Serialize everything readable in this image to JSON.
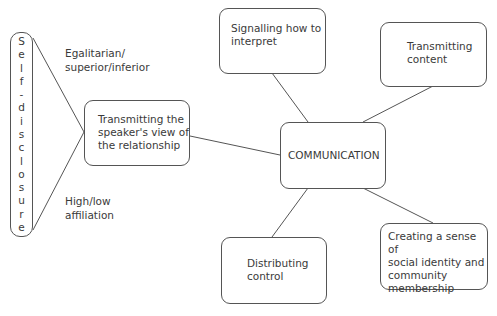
{
  "diagram": {
    "type": "concept-map",
    "central_node": {
      "id": "communication",
      "label": "COMMUNICATION"
    },
    "nodes": {
      "signalling": {
        "label": "Signalling how to\ninterpret"
      },
      "transmitting_content": {
        "label": "Transmitting\ncontent"
      },
      "relationship": {
        "label": "Transmitting the\nspeaker's view of\nthe relationship"
      },
      "distributing": {
        "label": "Distributing\ncontrol"
      },
      "identity": {
        "label": "Creating a sense of\nsocial identity and\ncommunity\nmembership"
      }
    },
    "self_disclosure": {
      "label": "Self-disclosure",
      "letters": [
        "S",
        "e",
        "l",
        "f",
        "-",
        "d",
        "i",
        "s",
        "c",
        "l",
        "o",
        "s",
        "u",
        "r",
        "e"
      ]
    },
    "annotations": {
      "egalitarian": "Egalitarian/\nsuperior/inferior",
      "affiliation": "High/low\naffiliation"
    },
    "edges": [
      {
        "from": "communication",
        "to": "signalling"
      },
      {
        "from": "communication",
        "to": "transmitting_content"
      },
      {
        "from": "communication",
        "to": "relationship"
      },
      {
        "from": "communication",
        "to": "distributing"
      },
      {
        "from": "communication",
        "to": "identity"
      },
      {
        "from": "self_disclosure",
        "to": "relationship",
        "note": "top"
      },
      {
        "from": "self_disclosure",
        "to": "relationship",
        "note": "bottom"
      }
    ],
    "colors": {
      "stroke": "#555555",
      "text": "#3a3a3a",
      "background": "#ffffff"
    }
  }
}
